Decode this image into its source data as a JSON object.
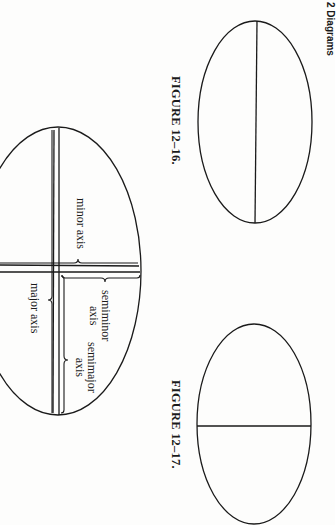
{
  "page": {
    "orientation": "rotated-90-clockwise",
    "running_header": "2 Diagrams",
    "ink_color": "#1a1a1a",
    "paper_color": "#fdfdfc"
  },
  "figures": [
    {
      "id": "fig-12-16",
      "caption": "FIGURE 12–16.",
      "description": "Ellipse with its major axis drawn as a single line"
    },
    {
      "id": "fig-labeled",
      "caption": "",
      "description": "Ellipse with labeled axes",
      "labels": {
        "minor_axis": "minor axis",
        "semiminor_axis_line1": "semiminor",
        "semiminor_axis_line2": "axis",
        "major_axis": "major axis",
        "semimajor_axis_line1": "semimajor",
        "semimajor_axis_line2": "axis"
      }
    },
    {
      "id": "fig-12-17",
      "caption": "FIGURE 12–17.",
      "description": "Ellipse with its minor axis drawn as a single line"
    }
  ]
}
